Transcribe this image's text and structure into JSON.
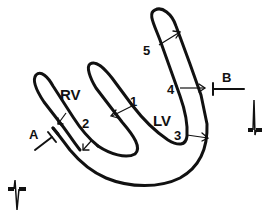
{
  "figure": {
    "type": "cardiac ventricle cross-section schematic",
    "chambers": {
      "rv": "RV",
      "lv": "LV"
    },
    "segments": [
      "1",
      "2",
      "3",
      "4",
      "5"
    ],
    "markers": {
      "a": "A",
      "b": "B"
    },
    "icons": {
      "ecg_left": "ecg-complex-icon",
      "ecg_right": "ecg-complex-icon"
    },
    "colors": {
      "ink": "#111111",
      "background": "#ffffff"
    }
  }
}
